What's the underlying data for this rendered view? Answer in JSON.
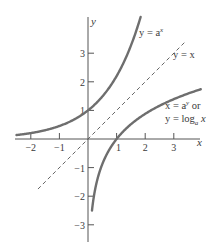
{
  "chart_data": {
    "type": "line",
    "title": "",
    "xlabel": "x",
    "ylabel": "y",
    "xlim": [
      -2.3,
      3.6
    ],
    "ylim": [
      -3.3,
      4.4
    ],
    "grid": false,
    "x_ticks": [
      -2,
      -1,
      1,
      2,
      3
    ],
    "y_ticks": [
      -3,
      -2,
      -1,
      1,
      2,
      3
    ],
    "x_tick_labels": [
      "−2",
      "−1",
      "1",
      "2",
      "3"
    ],
    "y_tick_labels": [
      "−3",
      "−2",
      "−1",
      "1",
      "2",
      "3"
    ],
    "base_a": 2.2,
    "series": [
      {
        "name": "y = a^x",
        "style": "solid",
        "x": [
          -2.5,
          -2,
          -1,
          0,
          1,
          1.5,
          1.86
        ],
        "y": [
          0.14,
          0.21,
          0.45,
          1,
          2.2,
          3.26,
          4.33
        ]
      },
      {
        "name": "y = x",
        "style": "dashed",
        "x": [
          -1.75,
          3.4
        ],
        "y": [
          -1.75,
          3.4
        ]
      },
      {
        "name": "x = a^y or y = log_a x",
        "style": "solid",
        "x": [
          0.14,
          0.21,
          0.45,
          1,
          2.2,
          3.26,
          4.0
        ],
        "y": [
          -2.5,
          -2,
          -1,
          0,
          1,
          1.5,
          1.76
        ]
      }
    ],
    "annotations": [
      {
        "text": "y = a",
        "sup": "x",
        "anchor": [
          1.6,
          4.1
        ]
      },
      {
        "text": "y = x",
        "anchor": [
          2.95,
          3.05
        ]
      },
      {
        "line1": "x = a",
        "sup": "y",
        "line1_suffix": " or",
        "line2": "y = log",
        "sub": "a",
        "line2_suffix": " x",
        "anchor": [
          2.75,
          0.75
        ]
      }
    ]
  },
  "labels": {
    "x_axis": "x",
    "y_axis": "y",
    "exp_curve_prefix": "y = a",
    "exp_curve_sup": "x",
    "identity_line": "y = x",
    "log_curve_line1_prefix": "x = a",
    "log_curve_line1_sup": "y",
    "log_curve_line1_suffix": " or",
    "log_curve_line2_prefix": "y = log",
    "log_curve_line2_sub": "a",
    "log_curve_line2_suffix": " x"
  },
  "colors": {
    "curve": "#6e6e6e",
    "axis": "#555555",
    "dashed": "#555555",
    "text": "#3a3a3a"
  }
}
